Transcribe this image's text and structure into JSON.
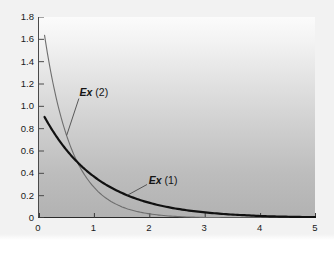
{
  "chart_data": {
    "type": "line",
    "title": "",
    "subtitle": "",
    "xlabel": "",
    "ylabel": "",
    "xlim": [
      0,
      5
    ],
    "ylim": [
      0,
      1.8
    ],
    "grid": false,
    "legend_position": "inline-annotations",
    "x_ticks": [
      "0",
      "1",
      "2",
      "3",
      "4",
      "5"
    ],
    "x_tick_values": [
      0,
      1,
      2,
      3,
      4,
      5
    ],
    "y_ticks": [
      "0",
      "0.2",
      "0.4",
      "0.6",
      "0.8",
      "1.0",
      "1.2",
      "1.4",
      "1.6",
      "1.8"
    ],
    "y_tick_values": [
      0,
      0.2,
      0.4,
      0.6,
      0.8,
      1.0,
      1.2,
      1.4,
      1.6,
      1.8
    ],
    "annotations": [
      {
        "text_em": "Ex",
        "text_rest": " (2)",
        "label": "Ex (2)",
        "x": 0.75,
        "y": 1.12
      },
      {
        "text_em": "Ex",
        "text_rest": " (1)",
        "label": "Ex (1)",
        "x": 2.0,
        "y": 0.33
      }
    ],
    "series": [
      {
        "name": "Ex (2)",
        "color": "#6e6e6e",
        "width": 1.1,
        "formula": "2*exp(-2x)",
        "x": [
          0.1,
          0.2,
          0.3,
          0.4,
          0.5,
          0.6,
          0.7,
          0.75,
          0.8,
          0.9,
          1.0,
          1.2,
          1.4,
          1.6,
          1.8,
          2.0,
          2.25,
          2.5,
          2.75,
          3.0,
          3.25,
          3.5,
          4.0,
          4.5,
          5.0
        ],
        "values": [
          1.637,
          1.341,
          1.098,
          0.899,
          0.736,
          0.602,
          0.493,
          0.446,
          0.404,
          0.331,
          0.271,
          0.181,
          0.122,
          0.081,
          0.055,
          0.037,
          0.022,
          0.013,
          0.008,
          0.005,
          0.003,
          0.002,
          0.001,
          0.0,
          0.0
        ]
      },
      {
        "name": "Ex (1)",
        "color": "#111111",
        "width": 2.2,
        "formula": "exp(-x)",
        "x": [
          0.1,
          0.2,
          0.3,
          0.4,
          0.5,
          0.6,
          0.7,
          0.75,
          0.8,
          0.9,
          1.0,
          1.2,
          1.4,
          1.6,
          1.8,
          2.0,
          2.25,
          2.5,
          2.75,
          3.0,
          3.25,
          3.5,
          3.75,
          4.0,
          4.25,
          4.5,
          4.75,
          5.0
        ],
        "values": [
          0.905,
          0.819,
          0.741,
          0.67,
          0.607,
          0.549,
          0.497,
          0.472,
          0.449,
          0.407,
          0.368,
          0.301,
          0.247,
          0.202,
          0.165,
          0.135,
          0.105,
          0.082,
          0.064,
          0.05,
          0.039,
          0.03,
          0.024,
          0.018,
          0.014,
          0.011,
          0.009,
          0.007
        ]
      }
    ]
  }
}
